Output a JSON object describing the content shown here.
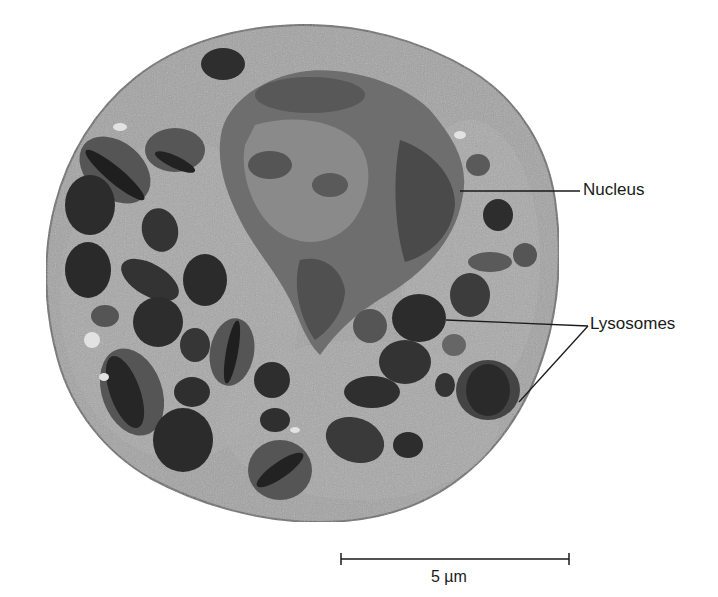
{
  "figure": {
    "type": "electron micrograph"
  },
  "labels": [
    {
      "id": "nucleus",
      "text": "Nucleus",
      "x": 583,
      "y": 180
    },
    {
      "id": "lysosomes",
      "text": "Lysosomes",
      "x": 590,
      "y": 293
    }
  ],
  "leader_lines": [
    {
      "label": "nucleus",
      "from": [
        460,
        191
      ],
      "to": [
        580,
        191
      ]
    },
    {
      "label": "lysosomes",
      "from": [
        446,
        320
      ],
      "to": [
        588,
        326
      ]
    },
    {
      "label": "lysosomes",
      "from": [
        519,
        402
      ],
      "to": [
        588,
        326
      ]
    }
  ],
  "scale_bar": {
    "text": "5 µm",
    "x1": 341,
    "x2": 569,
    "y": 559
  },
  "colors": {
    "background": "#ffffff",
    "cytoplasm": "#9c9c9c",
    "cytoplasm_light": "#b4b4b4",
    "nucleus": "#4a4a4a",
    "nucleus_light": "#7a7a7a",
    "granule_dark": "#2b2b2b",
    "granule_mid": "#555555",
    "line": "#1a1a1a"
  }
}
